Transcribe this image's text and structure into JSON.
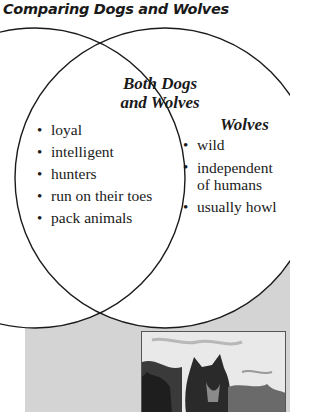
{
  "title": "Comparing Dogs and Wolves",
  "venn": {
    "left_circle": {
      "label": "Dogs",
      "cx": 35,
      "cy": 178,
      "r": 150
    },
    "right_circle": {
      "label": "Wolves",
      "cx": 165,
      "cy": 178,
      "r": 150
    },
    "stroke_color": "#1a1a1a"
  },
  "overlap": {
    "heading_line1": "Both Dogs",
    "heading_line2": "and Wolves",
    "items": [
      "loyal",
      "intelligent",
      "hunters",
      "run on their toes",
      "pack animals"
    ]
  },
  "wolves": {
    "heading": "Wolves",
    "items": [
      "wild",
      "independent of humans",
      "usually howl"
    ]
  },
  "background_panel_color": "#d4d4d4",
  "photo": {
    "subject": "wolf-photo",
    "description": "Black-and-white photograph of a wolf in snow"
  }
}
